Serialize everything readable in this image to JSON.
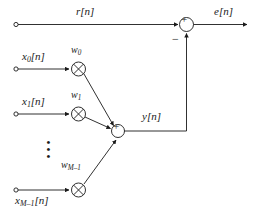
{
  "diagram": {
    "stroke_color": "#1a1a1a",
    "background": "#ffffff",
    "labels": {
      "reference_input": {
        "base": "r",
        "bracket": "[n]"
      },
      "error_output": {
        "base": "e",
        "bracket": "[n]"
      },
      "filter_output": {
        "base": "y",
        "bracket": "[n]"
      },
      "input_0": {
        "base": "x",
        "sub": "0",
        "bracket": "[n]"
      },
      "input_1": {
        "base": "x",
        "sub": "1",
        "bracket": "[n]"
      },
      "input_m": {
        "base": "x",
        "sub": "M–1",
        "bracket": "[n]"
      },
      "weight_0": {
        "base": "w",
        "sub": "0"
      },
      "weight_1": {
        "base": "w",
        "sub": "1"
      },
      "weight_m": {
        "base": "w",
        "sub": "M–1"
      },
      "minus_sign": "−",
      "plus_sign": "+",
      "times_sign": "×",
      "vertical_ellipsis": "⋮"
    }
  }
}
